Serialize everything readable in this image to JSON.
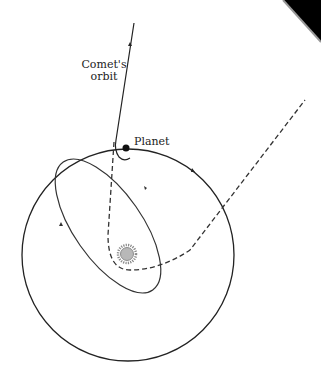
{
  "diagram": {
    "labels": {
      "comet_line1": "Comet's",
      "comet_line2": "orbit",
      "planet": "Planet"
    },
    "elements": {
      "planet_orbit": "large circular orbit around the Sun",
      "comet_original_orbit": "incoming comet trajectory (solid)",
      "comet_new_orbit": "elliptical orbit after encounter",
      "comet_hyperbolic_path": "dashed path around the Sun",
      "sun": "Sun"
    },
    "colors": {
      "line": "#222222",
      "sun_core": "#b8b8b8",
      "sun_rays": "#888888",
      "corner": "#000000"
    }
  }
}
